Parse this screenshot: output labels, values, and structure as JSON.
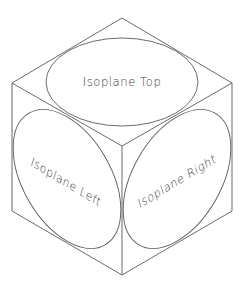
{
  "diagram": {
    "type": "isometric-cube",
    "stroke_color": "#5a5a5a",
    "text_color": "#3a3a3a",
    "background": "#ffffff",
    "vertices": {
      "top": [
        122,
        18
      ],
      "left": [
        12,
        83
      ],
      "right": [
        232,
        83
      ],
      "center": [
        122,
        146
      ],
      "bottom_left": [
        12,
        211
      ],
      "bottom_right": [
        232,
        211
      ],
      "bottom": [
        122,
        275
      ]
    },
    "faces": [
      {
        "id": "top",
        "label": "Isoplane Top"
      },
      {
        "id": "left",
        "label": "Isoplane Left"
      },
      {
        "id": "right",
        "label": "Isoplane Right"
      }
    ]
  }
}
